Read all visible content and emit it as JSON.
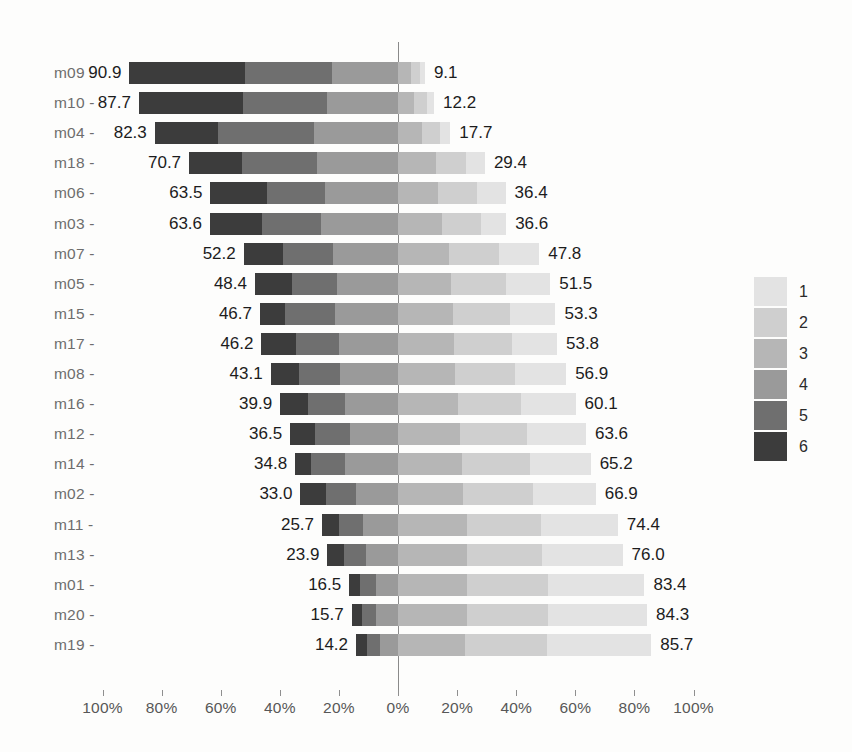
{
  "chart_data": {
    "type": "bar",
    "subtype": "diverging-stacked-bar-likert",
    "title": "",
    "subtitle": "",
    "xlabel": "",
    "ylabel": "",
    "grid": false,
    "legend_position": "right",
    "legend_title": "",
    "axis": {
      "tick_labels": [
        "100%",
        "80%",
        "60%",
        "40%",
        "20%",
        "0%",
        "20%",
        "40%",
        "60%",
        "80%",
        "100%"
      ],
      "tick_values": [
        -100,
        -80,
        -60,
        -40,
        -20,
        0,
        20,
        40,
        60,
        80,
        100
      ],
      "xlim": [
        -100,
        100
      ],
      "zero_at": "0%"
    },
    "legend": [
      {
        "label": "1",
        "color": "#e3e3e3"
      },
      {
        "label": "2",
        "color": "#cfcfcf"
      },
      {
        "label": "3",
        "color": "#b6b6b6"
      },
      {
        "label": "4",
        "color": "#9a9a9a"
      },
      {
        "label": "5",
        "color": "#6f6f6f"
      },
      {
        "label": "6",
        "color": "#3c3c3c"
      }
    ],
    "categories": [
      "m09",
      "m10",
      "m04",
      "m18",
      "m06",
      "m03",
      "m07",
      "m05",
      "m15",
      "m17",
      "m08",
      "m16",
      "m12",
      "m14",
      "m02",
      "m11",
      "m13",
      "m01",
      "m20",
      "m19"
    ],
    "series": [
      {
        "name": "1",
        "color": "#e3e3e3",
        "side": "right",
        "values": [
          1.6,
          2.4,
          3.5,
          6.3,
          9.6,
          8.4,
          13.5,
          15.0,
          15.4,
          15.1,
          17.2,
          18.4,
          19.9,
          20.6,
          21.2,
          25.9,
          27.1,
          32.8,
          33.6,
          35.2
        ]
      },
      {
        "name": "2",
        "color": "#cfcfcf",
        "side": "right",
        "values": [
          3.2,
          4.3,
          6.1,
          10.2,
          13.2,
          13.4,
          17.1,
          18.6,
          19.3,
          19.6,
          20.4,
          21.3,
          22.6,
          23.1,
          23.6,
          25.3,
          25.7,
          27.2,
          27.5,
          27.8
        ]
      },
      {
        "name": "3",
        "color": "#b6b6b6",
        "side": "right",
        "values": [
          4.3,
          5.5,
          8.1,
          12.9,
          13.6,
          14.8,
          17.2,
          17.9,
          18.6,
          19.1,
          19.3,
          20.4,
          21.1,
          21.5,
          22.1,
          23.2,
          23.2,
          23.4,
          23.2,
          22.7
        ]
      },
      {
        "name": "4",
        "color": "#9a9a9a",
        "side": "left",
        "values": [
          22.4,
          23.9,
          28.5,
          27.4,
          24.8,
          26.0,
          21.9,
          20.8,
          21.4,
          19.8,
          19.5,
          17.8,
          16.4,
          17.9,
          14.1,
          11.8,
          10.9,
          7.5,
          7.3,
          6.2
        ]
      },
      {
        "name": "5",
        "color": "#6f6f6f",
        "side": "left",
        "values": [
          29.5,
          28.4,
          32.3,
          25.4,
          19.4,
          20.1,
          17.0,
          15.1,
          16.8,
          14.7,
          14.0,
          12.5,
          11.6,
          11.4,
          10.2,
          8.1,
          7.5,
          5.3,
          5.0,
          4.4
        ]
      },
      {
        "name": "6",
        "color": "#3c3c3c",
        "side": "left",
        "values": [
          39.0,
          35.4,
          21.5,
          17.9,
          19.3,
          17.5,
          13.3,
          12.5,
          8.5,
          11.7,
          9.6,
          9.6,
          8.5,
          5.5,
          8.7,
          5.8,
          5.5,
          3.7,
          3.4,
          3.6
        ]
      }
    ],
    "rows": [
      {
        "category": "m09",
        "left_total": "90.9",
        "right_total": "9.1",
        "left_value": 90.9,
        "right_value": 9.1
      },
      {
        "category": "m10",
        "left_total": "87.7",
        "right_total": "12.2",
        "left_value": 87.7,
        "right_value": 12.2
      },
      {
        "category": "m04",
        "left_total": "82.3",
        "right_total": "17.7",
        "left_value": 82.3,
        "right_value": 17.7
      },
      {
        "category": "m18",
        "left_total": "70.7",
        "right_total": "29.4",
        "left_value": 70.7,
        "right_value": 29.4
      },
      {
        "category": "m06",
        "left_total": "63.5",
        "right_total": "36.4",
        "left_value": 63.5,
        "right_value": 36.4
      },
      {
        "category": "m03",
        "left_total": "63.6",
        "right_total": "36.6",
        "left_value": 63.6,
        "right_value": 36.6
      },
      {
        "category": "m07",
        "left_total": "52.2",
        "right_total": "47.8",
        "left_value": 52.2,
        "right_value": 47.8
      },
      {
        "category": "m05",
        "left_total": "48.4",
        "right_total": "51.5",
        "left_value": 48.4,
        "right_value": 51.5
      },
      {
        "category": "m15",
        "left_total": "46.7",
        "right_total": "53.3",
        "left_value": 46.7,
        "right_value": 53.3
      },
      {
        "category": "m17",
        "left_total": "46.2",
        "right_total": "53.8",
        "left_value": 46.2,
        "right_value": 53.8
      },
      {
        "category": "m08",
        "left_total": "43.1",
        "right_total": "56.9",
        "left_value": 43.1,
        "right_value": 56.9
      },
      {
        "category": "m16",
        "left_total": "39.9",
        "right_total": "60.1",
        "left_value": 39.9,
        "right_value": 60.1
      },
      {
        "category": "m12",
        "left_total": "36.5",
        "right_total": "63.6",
        "left_value": 36.5,
        "right_value": 63.6
      },
      {
        "category": "m14",
        "left_total": "34.8",
        "right_total": "65.2",
        "left_value": 34.8,
        "right_value": 65.2
      },
      {
        "category": "m02",
        "left_total": "33.0",
        "right_total": "66.9",
        "left_value": 33.0,
        "right_value": 66.9
      },
      {
        "category": "m11",
        "left_total": "25.7",
        "right_total": "74.4",
        "left_value": 25.7,
        "right_value": 74.4
      },
      {
        "category": "m13",
        "left_total": "23.9",
        "right_total": "76.0",
        "left_value": 23.9,
        "right_value": 76.0
      },
      {
        "category": "m01",
        "left_total": "16.5",
        "right_total": "83.4",
        "left_value": 16.5,
        "right_value": 83.4
      },
      {
        "category": "m20",
        "left_total": "15.7",
        "right_total": "84.3",
        "left_value": 15.7,
        "right_value": 84.3
      },
      {
        "category": "m19",
        "left_total": "14.2",
        "right_total": "85.7",
        "left_value": 14.2,
        "right_value": 85.7
      }
    ]
  }
}
